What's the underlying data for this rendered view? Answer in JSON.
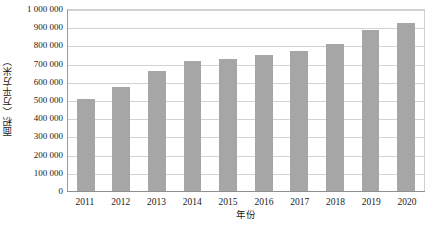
{
  "chart_data": {
    "type": "bar",
    "title": "",
    "subtitle": "",
    "xlabel": "年份",
    "ylabel": "面积（万平方米）",
    "categories": [
      "2011",
      "2012",
      "2013",
      "2014",
      "2015",
      "2016",
      "2017",
      "2018",
      "2019",
      "2020"
    ],
    "values": [
      512000,
      578000,
      664000,
      718000,
      733000,
      752000,
      775000,
      812000,
      890000,
      927000
    ],
    "ylim": [
      0,
      1000000
    ],
    "ytick_values": [
      0,
      100000,
      200000,
      300000,
      400000,
      500000,
      600000,
      700000,
      800000,
      900000,
      1000000
    ],
    "ytick_labels": [
      "0",
      "100 000",
      "200 000",
      "300 000",
      "400 000",
      "500 000",
      "600 000",
      "700 000",
      "800 000",
      "900 000",
      "1 000 000"
    ],
    "grid": true,
    "grid_axis": "y",
    "legend": false,
    "legend_position": "none",
    "bar_color": "#a6a6a6",
    "gridline_color": "#d3d3d3",
    "axis_color": "#8f8f8f",
    "background_color": "#ffffff",
    "bar_width_ratio": 0.5
  }
}
